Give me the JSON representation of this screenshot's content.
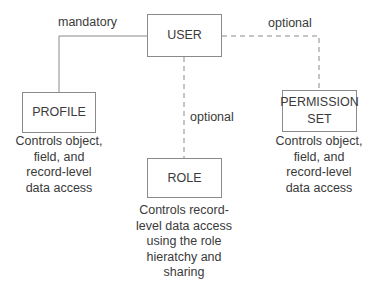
{
  "diagram": {
    "nodes": {
      "user": {
        "label": "USER"
      },
      "profile": {
        "label": "PROFILE",
        "description": "Controls object,\nfield, and\nrecord-level\ndata access"
      },
      "role": {
        "label": "ROLE",
        "description": "Controls record-\nlevel data access\nusing the role\nhieratchy and\nsharing"
      },
      "permission_set": {
        "label": "PERMISSION\nSET",
        "description": "Controls object,\nfield, and\nrecord-level\ndata access"
      }
    },
    "edges": [
      {
        "from": "USER",
        "to": "PROFILE",
        "label": "mandatory",
        "style": "solid"
      },
      {
        "from": "USER",
        "to": "ROLE",
        "label": "optional",
        "style": "dashed"
      },
      {
        "from": "USER",
        "to": "PERMISSION SET",
        "label": "optional",
        "style": "dashed"
      }
    ]
  },
  "colors": {
    "line": "#8a8a8a",
    "text": "#3a3a3a",
    "background": "#ffffff"
  }
}
